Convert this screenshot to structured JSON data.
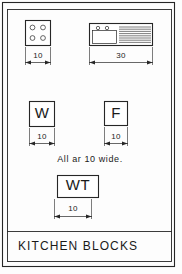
{
  "sheet": {
    "title": "KITCHEN BLOCKS",
    "note": "All ar 10 wide.",
    "border_color": "#262626",
    "background_color": "#fdfdfd"
  },
  "blocks": [
    {
      "id": "cooktop",
      "name": "four-burner-cooktop",
      "label": "",
      "dimension": "10",
      "burner_count": 4
    },
    {
      "id": "sink",
      "name": "sink-with-drainboard",
      "label": "",
      "dimension": "30",
      "faucet_count": 2,
      "drainboard_line_count": 8
    },
    {
      "id": "washer",
      "name": "washer-block",
      "label": "W",
      "dimension": "10"
    },
    {
      "id": "fridge",
      "name": "refrigerator-block",
      "label": "F",
      "dimension": "10"
    },
    {
      "id": "worktop",
      "name": "worktop-block",
      "label": "WT",
      "dimension": "10"
    }
  ]
}
